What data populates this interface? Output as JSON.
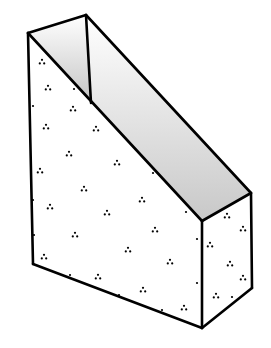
{
  "figure": {
    "background": "#ffffff",
    "stroke": "#000000",
    "stroke_width": 2.6,
    "shade_dark": "#c8c8c8",
    "shade_light": "#ffffff",
    "vertices": {
      "front_top_left": [
        28,
        33
      ],
      "back_top": [
        86,
        15
      ],
      "inner_back_bottom": [
        91,
        103
      ],
      "right_top_back": [
        251,
        193
      ],
      "front_top_right": [
        202,
        221
      ],
      "front_bottom_right": [
        202,
        328
      ],
      "right_bottom_back": [
        252,
        288
      ],
      "front_bottom_left": [
        33,
        264
      ]
    },
    "dot_clusters": [
      [
        42,
        62
      ],
      [
        48,
        88
      ],
      [
        73,
        109
      ],
      [
        46,
        127
      ],
      [
        96,
        129
      ],
      [
        69,
        154
      ],
      [
        40,
        171
      ],
      [
        117,
        163
      ],
      [
        84,
        189
      ],
      [
        50,
        207
      ],
      [
        142,
        200
      ],
      [
        107,
        213
      ],
      [
        75,
        235
      ],
      [
        44,
        257
      ],
      [
        155,
        230
      ],
      [
        128,
        250
      ],
      [
        98,
        277
      ],
      [
        170,
        262
      ],
      [
        143,
        290
      ],
      [
        184,
        308
      ],
      [
        227,
        216
      ],
      [
        243,
        229
      ],
      [
        210,
        245
      ],
      [
        230,
        264
      ],
      [
        243,
        278
      ],
      [
        216,
        296
      ]
    ],
    "single_dots": [
      [
        33,
        106
      ],
      [
        33,
        200
      ],
      [
        34,
        235
      ],
      [
        70,
        275
      ],
      [
        119,
        295
      ],
      [
        162,
        310
      ],
      [
        186,
        212
      ],
      [
        197,
        239
      ],
      [
        197,
        283
      ],
      [
        232,
        297
      ],
      [
        153,
        173
      ],
      [
        74,
        89
      ]
    ]
  }
}
